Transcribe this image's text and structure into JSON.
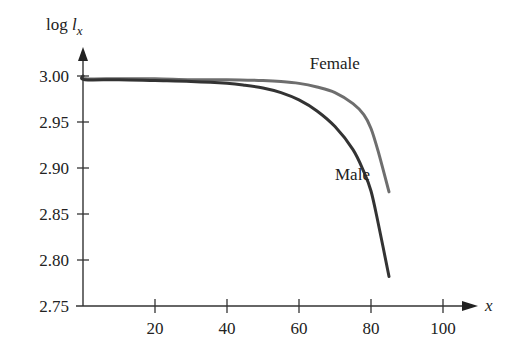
{
  "chart_data": {
    "type": "line",
    "title": "",
    "xlabel": "x",
    "ylabel": "log l_x",
    "ylabel_parts": {
      "main": "log ",
      "var": "l",
      "sub": "x"
    },
    "xlim": [
      0,
      105
    ],
    "ylim": [
      2.75,
      3.02
    ],
    "x_ticks": [
      20,
      40,
      60,
      80,
      100
    ],
    "x_tick_labels": [
      "20",
      "40",
      "60",
      "80",
      "100"
    ],
    "y_ticks": [
      3.0,
      2.95,
      2.9,
      2.85,
      2.8,
      2.75
    ],
    "y_tick_labels": [
      "3.00",
      "2.95",
      "2.90",
      "2.85",
      "2.80",
      "2.75"
    ],
    "grid": false,
    "legend": "inline labels",
    "series": [
      {
        "name": "Female",
        "color": "#6e6e6e",
        "x": [
          0,
          0.5,
          10,
          20,
          30,
          40,
          50,
          55,
          60,
          65,
          70,
          75,
          78,
          80,
          82,
          85
        ],
        "y": [
          3.0,
          2.997,
          2.997,
          2.997,
          2.996,
          2.996,
          2.995,
          2.994,
          2.992,
          2.988,
          2.982,
          2.97,
          2.958,
          2.943,
          2.918,
          2.874
        ]
      },
      {
        "name": "Male",
        "color": "#333333",
        "x": [
          0,
          0.5,
          10,
          20,
          30,
          40,
          45,
          50,
          55,
          60,
          65,
          70,
          75,
          78,
          80,
          82,
          85
        ],
        "y": [
          3.0,
          2.996,
          2.996,
          2.995,
          2.994,
          2.992,
          2.99,
          2.987,
          2.982,
          2.974,
          2.962,
          2.945,
          2.92,
          2.896,
          2.875,
          2.84,
          2.782
        ]
      }
    ],
    "annotations": [
      {
        "text": "Female",
        "x": 63,
        "y": 3.008
      },
      {
        "text": "Male",
        "x": 70,
        "y": 2.887
      }
    ]
  }
}
